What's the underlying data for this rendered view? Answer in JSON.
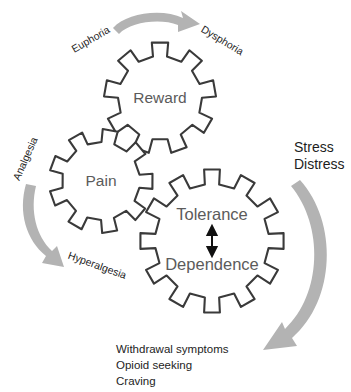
{
  "diagram": {
    "type": "concept-diagram",
    "canvas": {
      "width": 351,
      "height": 392
    },
    "colors": {
      "background": "#ffffff",
      "gear_outline": "#3a3a3a",
      "gear_fill": "#ffffff",
      "gear_label_text": "#5b5b5b",
      "arrow_gray": "#b3b3b3",
      "arrow_black": "#111111",
      "label_text": "#1d1d1d"
    },
    "gears": [
      {
        "id": "reward",
        "label": "Reward",
        "teeth": 9,
        "cx": 160,
        "cy": 98,
        "outer_radius": 56,
        "inner_radius": 42
      },
      {
        "id": "pain",
        "label": "Pain",
        "teeth": 9,
        "cx": 101,
        "cy": 181,
        "outer_radius": 52,
        "inner_radius": 39
      },
      {
        "id": "tolerance-dependence",
        "label_top": "Tolerance",
        "label_bottom": "Dependence",
        "teeth": 12,
        "cx": 212,
        "cy": 241,
        "outer_radius": 72,
        "inner_radius": 57
      }
    ],
    "curved_labels": [
      {
        "id": "euphoria",
        "text": "Euphoria",
        "x": 91,
        "y": 40,
        "rotation": -30
      },
      {
        "id": "dysphoria",
        "text": "Dysphoria",
        "x": 222,
        "y": 41,
        "rotation": 31
      },
      {
        "id": "analgesia",
        "text": "Analgesia",
        "x": 26,
        "y": 159,
        "rotation": -66
      },
      {
        "id": "hyperalgesia",
        "text": "Hyperalgesia",
        "x": 97,
        "y": 266,
        "rotation": 20
      }
    ],
    "side_labels": [
      {
        "id": "stress",
        "text": "Stress",
        "x": 294,
        "y": 148
      },
      {
        "id": "distress",
        "text": "Distress",
        "x": 294,
        "y": 165
      }
    ],
    "outcome_labels": [
      {
        "id": "withdrawal-symptoms",
        "text": "Withdrawal symptoms",
        "x": 116,
        "y": 350
      },
      {
        "id": "opioid-seeking",
        "text": "Opioid seeking",
        "x": 116,
        "y": 366
      },
      {
        "id": "craving",
        "text": "Craving",
        "x": 116,
        "y": 382
      }
    ],
    "arrows": [
      {
        "id": "top-arrow",
        "semantic": "euphoria-to-dysphoria-arrow",
        "color": "#b3b3b3",
        "direction": "left-to-right",
        "shape": "curved"
      },
      {
        "id": "left-arrow",
        "semantic": "analgesia-to-hyperalgesia-arrow",
        "color": "#b3b3b3",
        "direction": "top-to-bottom",
        "shape": "curved"
      },
      {
        "id": "right-arrow",
        "semantic": "stress-distress-to-withdrawal-arrow",
        "color": "#b3b3b3",
        "direction": "clockwise-down-left",
        "shape": "large-arc"
      },
      {
        "id": "tolerance-dependence-arrow",
        "semantic": "tolerance-dependence-double-arrow",
        "color": "#111111",
        "direction": "bidirectional-vertical",
        "shape": "straight"
      }
    ]
  }
}
